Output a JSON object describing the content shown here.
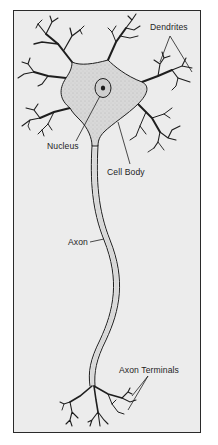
{
  "diagram": {
    "labels": {
      "dendrites": "Dendrites",
      "nucleus": "Nucleus",
      "cell_body": "Cell Body",
      "axon": "Axon",
      "axon_terminals": "Axon Terminals"
    },
    "colors": {
      "background": "#ececec",
      "frame_border": "#2a2a2a",
      "cell_fill": "#dcdcdc",
      "outline": "#1e1e1e",
      "nucleus_fill": "#cfcfcf"
    }
  }
}
